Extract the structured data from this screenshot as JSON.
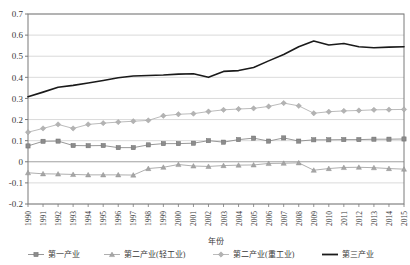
{
  "chart_data": {
    "type": "line",
    "title": "",
    "xlabel": "年份",
    "ylabel": "",
    "xlim": [
      1990,
      2015
    ],
    "ylim": [
      -0.2,
      0.7
    ],
    "ytick_values": [
      0.7,
      0.6,
      0.5,
      0.4,
      0.3,
      0.2,
      0.1,
      0,
      -0.1,
      -0.2
    ],
    "ytick_labels": [
      "0.7",
      "0.6",
      "0.5",
      "0.4",
      "0.3",
      "0.2",
      "0.1",
      "0",
      "-0.1",
      "-0.2"
    ],
    "grid": "horizontal",
    "legend_position": "bottom",
    "categories": [
      1990,
      1991,
      1992,
      1993,
      1994,
      1995,
      1996,
      1997,
      1998,
      1999,
      2000,
      2001,
      2002,
      2003,
      2004,
      2005,
      2006,
      2007,
      2008,
      2009,
      2010,
      2011,
      2012,
      2013,
      2014,
      2015
    ],
    "xtick_labels": [
      "1990",
      "1991",
      "1992",
      "1993",
      "1994",
      "1995",
      "1996",
      "1997",
      "1998",
      "1999",
      "2000",
      "2001",
      "2002",
      "2003",
      "2004",
      "2005",
      "2006",
      "2007",
      "2008",
      "2009",
      "2010",
      "2011",
      "2012",
      "2013",
      "2014",
      "2015"
    ],
    "series": [
      {
        "name": "第一产业",
        "marker": "square",
        "color": "#8c8c8c",
        "values": [
          0.075,
          0.097,
          0.098,
          0.077,
          0.076,
          0.077,
          0.067,
          0.067,
          0.08,
          0.086,
          0.086,
          0.088,
          0.1,
          0.093,
          0.105,
          0.112,
          0.098,
          0.113,
          0.098,
          0.104,
          0.104,
          0.105,
          0.105,
          0.107,
          0.107,
          0.108
        ]
      },
      {
        "name": "第二产业(轻工业)",
        "marker": "triangle",
        "color": "#a6a6a6",
        "values": [
          -0.052,
          -0.057,
          -0.058,
          -0.06,
          -0.062,
          -0.062,
          -0.062,
          -0.063,
          -0.032,
          -0.026,
          -0.013,
          -0.02,
          -0.022,
          -0.018,
          -0.016,
          -0.015,
          -0.008,
          -0.007,
          -0.005,
          -0.04,
          -0.032,
          -0.027,
          -0.026,
          -0.028,
          -0.032,
          -0.035
        ]
      },
      {
        "name": "第二产业(重工业)",
        "marker": "diamond",
        "color": "#b3b3b3",
        "values": [
          0.14,
          0.158,
          0.177,
          0.158,
          0.177,
          0.183,
          0.188,
          0.192,
          0.196,
          0.218,
          0.225,
          0.228,
          0.238,
          0.246,
          0.25,
          0.253,
          0.262,
          0.278,
          0.265,
          0.23,
          0.237,
          0.241,
          0.243,
          0.246,
          0.247,
          0.248
        ]
      },
      {
        "name": "第三产业",
        "marker": "none",
        "color": "#1a1a1a",
        "values": [
          0.308,
          0.33,
          0.353,
          0.362,
          0.373,
          0.385,
          0.398,
          0.406,
          0.409,
          0.411,
          0.415,
          0.417,
          0.4,
          0.428,
          0.432,
          0.447,
          0.478,
          0.508,
          0.545,
          0.572,
          0.553,
          0.56,
          0.545,
          0.54,
          0.543,
          0.545
        ]
      }
    ]
  },
  "legend": {
    "items": [
      {
        "label": "第一产业",
        "marker": "square"
      },
      {
        "label": "第二产业(轻工业)",
        "marker": "triangle"
      },
      {
        "label": "第二产业(重工业)",
        "marker": "diamond"
      },
      {
        "label": "第三产业",
        "marker": "line"
      }
    ]
  }
}
